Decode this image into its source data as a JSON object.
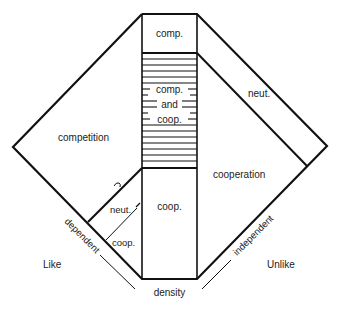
{
  "diagram": {
    "regions": {
      "top_box": "comp.",
      "hatched_line1": "comp.",
      "hatched_line2": "and",
      "hatched_line3": "coop.",
      "left_big": "competition",
      "right_band": "neut.",
      "right_big": "cooperation",
      "bottom_center": "coop.",
      "lower_left_upper": "neut.",
      "lower_left_lower": "coop."
    },
    "axes": {
      "left_edge": "dependent",
      "right_edge": "independent",
      "bottom": "density",
      "left_side": "Like",
      "right_side": "Unlike"
    },
    "colors": {
      "line": "#111111",
      "text": "#222222",
      "background": "#ffffff"
    }
  }
}
